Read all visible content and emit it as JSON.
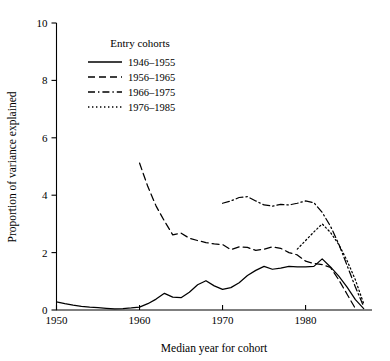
{
  "chart_data": {
    "type": "line",
    "title": "",
    "xlabel": "Median year for cohort",
    "ylabel": "Proportion of variance explained",
    "xlim": [
      1950,
      1988
    ],
    "ylim": [
      0,
      10
    ],
    "xticks": [
      1950,
      1960,
      1970,
      1980
    ],
    "yticks": [
      0,
      2,
      4,
      6,
      8,
      10
    ],
    "grid": false,
    "legend_title": "Entry cohorts",
    "legend_position": "upper-center",
    "series": [
      {
        "name": "1946–1955",
        "style": "solid",
        "x": [
          1950,
          1951,
          1952,
          1953,
          1954,
          1955,
          1956,
          1957,
          1958,
          1959,
          1960,
          1961,
          1962,
          1963,
          1964,
          1965,
          1966,
          1967,
          1968,
          1969,
          1970,
          1971,
          1972,
          1973,
          1974,
          1975,
          1976,
          1977,
          1978,
          1979,
          1980,
          1981,
          1982,
          1983,
          1984,
          1985,
          1986,
          1987
        ],
        "y": [
          0.28,
          0.22,
          0.17,
          0.13,
          0.1,
          0.08,
          0.06,
          0.04,
          0.05,
          0.07,
          0.1,
          0.22,
          0.38,
          0.58,
          0.45,
          0.43,
          0.62,
          0.88,
          1.02,
          0.84,
          0.72,
          0.78,
          0.95,
          1.2,
          1.38,
          1.52,
          1.42,
          1.46,
          1.52,
          1.5,
          1.5,
          1.52,
          1.78,
          1.5,
          1.18,
          0.8,
          0.36,
          0.05
        ]
      },
      {
        "name": "1956–1965",
        "style": "dashed",
        "x": [
          1960,
          1961,
          1962,
          1963,
          1964,
          1965,
          1966,
          1967,
          1968,
          1969,
          1970,
          1971,
          1972,
          1973,
          1974,
          1975,
          1976,
          1977,
          1978,
          1979,
          1980,
          1981,
          1982,
          1983,
          1984,
          1985,
          1986
        ],
        "y": [
          5.12,
          4.3,
          3.62,
          3.1,
          2.62,
          2.68,
          2.5,
          2.42,
          2.35,
          2.3,
          2.28,
          2.1,
          2.2,
          2.18,
          2.08,
          2.12,
          2.2,
          2.15,
          2.0,
          1.92,
          1.7,
          1.62,
          1.58,
          1.48,
          1.05,
          0.55,
          0.05
        ]
      },
      {
        "name": "1966–1975",
        "style": "dashdot",
        "x": [
          1970,
          1971,
          1972,
          1973,
          1974,
          1975,
          1976,
          1977,
          1978,
          1979,
          1980,
          1981,
          1982,
          1983,
          1984,
          1985,
          1986,
          1987
        ],
        "y": [
          3.72,
          3.8,
          3.92,
          3.95,
          3.8,
          3.66,
          3.62,
          3.68,
          3.66,
          3.72,
          3.8,
          3.74,
          3.4,
          2.92,
          2.3,
          1.55,
          0.8,
          0.12
        ]
      },
      {
        "name": "1976–1985",
        "style": "dotted",
        "x": [
          1979,
          1980,
          1981,
          1982,
          1983,
          1984,
          1985,
          1986,
          1987
        ],
        "y": [
          2.12,
          2.42,
          2.72,
          3.0,
          2.7,
          2.28,
          1.72,
          1.05,
          0.22
        ]
      }
    ]
  }
}
